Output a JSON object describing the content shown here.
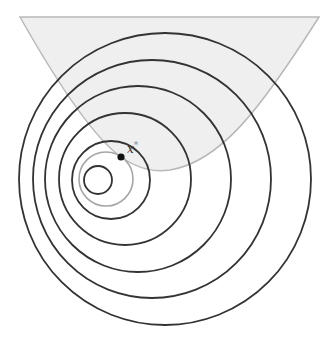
{
  "diagram": {
    "kind": "constrained-optimization-level-sets",
    "width": 329,
    "height": 341,
    "colors": {
      "background": "#ffffff",
      "feasible_fill": "#efefef",
      "feasible_stroke": "#b9b9b9",
      "level_set_stroke": "#333333",
      "gray_circle_stroke": "#a6a6a6",
      "point_fill": "#111111",
      "label_color": "#333333",
      "star_color": "#888888"
    },
    "feasible_region": {
      "path": "M20,17 C50,70 90,135 121,157 C140,170 155,172 170,170 C220,162 260,110 319,17 Z"
    },
    "level_sets": [
      {
        "cx": 165,
        "cy": 179,
        "r": 146
      },
      {
        "cx": 152,
        "cy": 179,
        "r": 119
      },
      {
        "cx": 138,
        "cy": 179,
        "r": 93
      },
      {
        "cx": 125,
        "cy": 179,
        "r": 66
      },
      {
        "cx": 111,
        "cy": 180,
        "r": 39
      }
    ],
    "gray_circle": {
      "cx": 106,
      "cy": 179,
      "r": 27
    },
    "inner_circle": {
      "cx": 98,
      "cy": 180,
      "r": 14
    },
    "optimum_point": {
      "cx": 121,
      "cy": 157,
      "r": 3.6
    },
    "optimum_label": {
      "text": "x",
      "superscript": "*",
      "x": 127,
      "y": 153
    }
  }
}
